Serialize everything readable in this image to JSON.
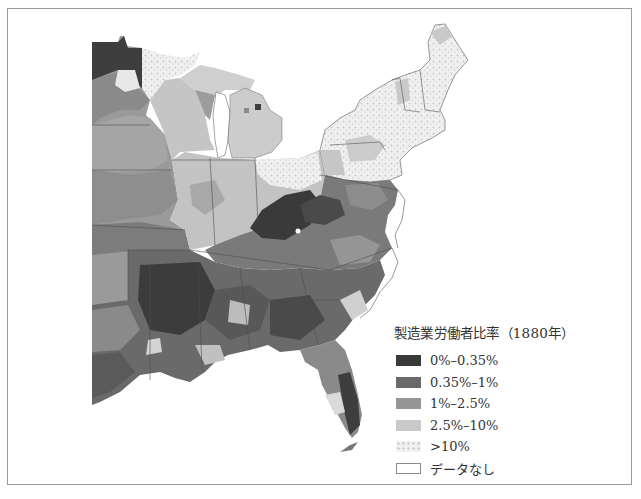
{
  "figure": {
    "type": "choropleth-map",
    "region": "Eastern United States (county level)"
  },
  "legend": {
    "title": "製造業労働者比率（1880年）",
    "items": [
      {
        "label": "0%–0.35%",
        "color": "#3a3a3a",
        "pattern": "solid"
      },
      {
        "label": "0.35%–1%",
        "color": "#6a6a6a",
        "pattern": "solid"
      },
      {
        "label": "1%–2.5%",
        "color": "#959595",
        "pattern": "solid"
      },
      {
        "label": "2.5%–10%",
        "color": "#c9c9c9",
        "pattern": "solid"
      },
      {
        "label": ">10%",
        "color": "#e6e6e6",
        "pattern": "speckled"
      },
      {
        "label": "データなし",
        "color": "#ffffff",
        "pattern": "outline"
      }
    ]
  },
  "colors": {
    "frame_border": "#9a9a9a",
    "state_border": "#555555",
    "background": "#ffffff"
  }
}
